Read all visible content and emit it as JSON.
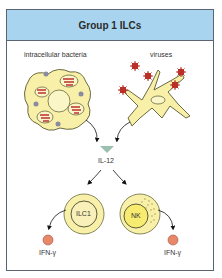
{
  "title": "Group 1 ILCs",
  "labels": {
    "intracellular_bacteria": "intracellular bacteria",
    "viruses": "viruses",
    "il12": "IL-12",
    "ilc1": "ILC1",
    "nk": "NK",
    "ifn_left": "IFN-γ",
    "ifn_right": "IFN-γ"
  },
  "colors": {
    "header_bg": "#a8d4f0",
    "border": "#5a6470",
    "cell_fill": "#f8f0a8",
    "cell_outline": "#6a6a40",
    "bacteria_red": "#c03030",
    "virus_red": "#b83028",
    "il12_triangle": "#9cc0b0",
    "ifn_fill": "#e88868"
  }
}
